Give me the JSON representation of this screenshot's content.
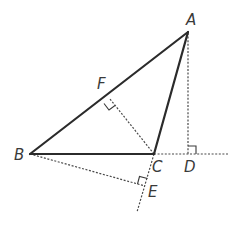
{
  "diagram": {
    "type": "geometry-triangle-with-altitudes",
    "points": {
      "A": {
        "label": "A",
        "x": 188,
        "y": 32
      },
      "B": {
        "label": "B",
        "x": 30,
        "y": 154
      },
      "C": {
        "label": "C",
        "x": 154,
        "y": 154
      },
      "D": {
        "label": "D",
        "x": 188,
        "y": 154
      },
      "E": {
        "label": "E",
        "x": 145,
        "y": 186
      },
      "F": {
        "label": "F",
        "x": 110,
        "y": 99
      }
    },
    "solid_segments": [
      "AB",
      "BC",
      "CA"
    ],
    "dashed_segments": [
      "AD",
      "CF",
      "BE",
      "C-extension-through-E",
      "BC-extension-through-D"
    ],
    "right_angles": [
      "F",
      "D",
      "E"
    ],
    "colors": {
      "line": "#2b2b2b",
      "dashed": "#4a4a4a",
      "label": "#3a3a3a",
      "background": "#ffffff"
    }
  },
  "labels": {
    "A": "A",
    "B": "B",
    "C": "C",
    "D": "D",
    "E": "E",
    "F": "F"
  }
}
